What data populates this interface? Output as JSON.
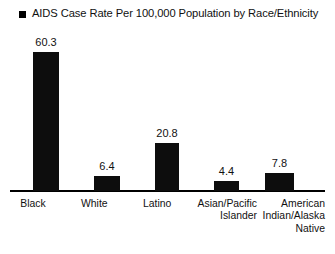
{
  "chart_data": {
    "type": "bar",
    "title": "AIDS Case Rate Per 100,000 Population by Race/Ethnicity",
    "xlabel": "",
    "ylabel": "",
    "ylim": [
      0,
      60.3
    ],
    "grid": false,
    "legend_position": "title-inline",
    "legend_marker": "filled-square",
    "bar_color": "#0d0d0d",
    "axis_color": "#000000",
    "categories": [
      "Black",
      "White",
      "Latino",
      "Asian/Pacific Islander",
      "American Indian/Alaska Native"
    ],
    "category_lines": [
      [
        "Black"
      ],
      [
        "White"
      ],
      [
        "Latino"
      ],
      [
        "Asian/Pacific",
        "Islander"
      ],
      [
        "American",
        "Indian/Alaska",
        "Native"
      ]
    ],
    "values": [
      60.3,
      6.4,
      20.8,
      4.4,
      7.8
    ],
    "value_labels": [
      "60.3",
      "6.4",
      "20.8",
      "4.4",
      "7.8"
    ]
  },
  "bars": [
    {
      "category": "Black",
      "label": "60.3",
      "category_text": "Black",
      "left": 33,
      "width": 26,
      "height": 139,
      "value_top": 36,
      "cat_left": 33,
      "cat_width": 26,
      "cat_align": "align-center"
    },
    {
      "category": "White",
      "label": "6.4",
      "category_text": "White",
      "left": 94,
      "width": 26,
      "height": 15,
      "value_top": 160,
      "cat_left": 94,
      "cat_width": 26,
      "cat_align": "align-center"
    },
    {
      "category": "Latino",
      "label": "20.8",
      "category_text": "Latino",
      "left": 155,
      "width": 24,
      "height": 48,
      "value_top": 127,
      "cat_left": 155,
      "cat_width": 24,
      "cat_align": "align-center"
    },
    {
      "category": "Asian/Pacific Islander",
      "label": "4.4",
      "category_text": "Asian/Pacific\nIslander",
      "left": 214,
      "width": 25,
      "height": 10,
      "value_top": 165,
      "cat_left": 187,
      "cat_width": 70,
      "cat_align": "align-right"
    },
    {
      "category": "American Indian/Alaska Native",
      "label": "7.8",
      "category_text": "American\nIndian/Alaska\nNative",
      "left": 265,
      "width": 29,
      "height": 18,
      "value_top": 157,
      "cat_left": 246,
      "cat_width": 79,
      "cat_align": "align-right"
    }
  ]
}
